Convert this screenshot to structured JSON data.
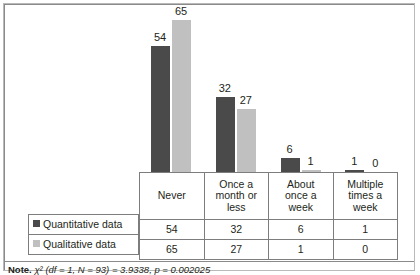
{
  "chart_data": {
    "type": "bar",
    "title": "",
    "subtitle": "",
    "xlabel": "",
    "ylabel": "",
    "ylim": [
      0,
      70
    ],
    "grid": false,
    "legend_position": "table-left",
    "categories": [
      "Never",
      "Once a month or less",
      "About once a week",
      "Multiple times a week"
    ],
    "series": [
      {
        "name": "Quantitative data",
        "color": "#4a4a4a",
        "values": [
          54,
          32,
          6,
          1
        ]
      },
      {
        "name": "Qualitative data",
        "color": "#c0c0c0",
        "values": [
          65,
          27,
          1,
          0
        ]
      }
    ],
    "data_labels": [
      [
        "54",
        "32",
        "6",
        "1"
      ],
      [
        "65",
        "27",
        "1",
        "0"
      ]
    ]
  },
  "table": {
    "column_headers": [
      [
        "Never"
      ],
      [
        "Once a",
        "month or",
        "less"
      ],
      [
        "About",
        "once a",
        "week"
      ],
      [
        "Multiple",
        "times a",
        "week"
      ]
    ],
    "rows": [
      {
        "label": "Quantitative data",
        "swatch": "dark-square-icon",
        "cells": [
          "54",
          "32",
          "6",
          "1"
        ]
      },
      {
        "label": "Qualitative data",
        "swatch": "light-square-icon",
        "cells": [
          "65",
          "27",
          "1",
          "0"
        ]
      }
    ]
  },
  "note": {
    "label": "Note.",
    "text": " χ² (df = 1, N = 93) = 3.9338, p = 0.002025"
  },
  "colors": {
    "series_quantitative": "#4a4a4a",
    "series_qualitative": "#c0c0c0",
    "border": "#7d7d7d",
    "frame": "#8a8a8a",
    "text": "#231f20"
  }
}
